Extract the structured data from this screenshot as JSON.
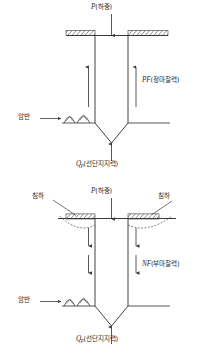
{
  "figure": {
    "title_visible": false,
    "background_color": "#ffffff",
    "line_color": "#3a3a3a",
    "text_color": "#2b2b2b"
  },
  "diagrams": [
    {
      "id": "positive-skin-friction",
      "load_label": {
        "symbol": "P",
        "text": "(하중)",
        "full": "P(하중)"
      },
      "friction_label": {
        "symbol": "PF",
        "text": "(정마찰력)",
        "full": "PF(정마찰력)"
      },
      "bedrock_label": "암반",
      "end_bearing_label": {
        "symbol": "Q",
        "subscript": "p",
        "text": "(선단지지력)",
        "full": "Qp(선단지지력)"
      },
      "friction_direction": "up",
      "ground_surface": "flat-hatched"
    },
    {
      "id": "negative-skin-friction",
      "load_label": {
        "symbol": "P",
        "text": "(하중)",
        "full": "P(하중)"
      },
      "friction_label": {
        "symbol": "NF",
        "text": "(부마찰력)",
        "full": "NF(부마찰력)"
      },
      "settlement_label_left": "침하",
      "settlement_label_right": "침하",
      "bedrock_label": "암반",
      "end_bearing_label": {
        "symbol": "Q",
        "subscript": "p",
        "text": "(선단지지력)",
        "full": "Qp(선단지지력)"
      },
      "friction_direction": "down",
      "ground_surface": "settled-hatched"
    }
  ]
}
